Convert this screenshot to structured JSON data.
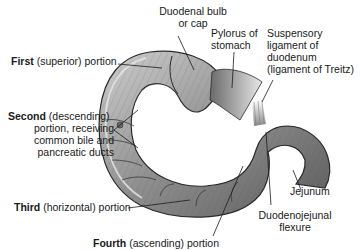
{
  "figure": {
    "colors": {
      "organ_fill": "#9a9a9a",
      "organ_dark": "#4a4a4a",
      "organ_light": "#d8d8d8",
      "outline": "#2a2a2a",
      "leader_line": "#1a1a1a",
      "background": "#ffffff"
    }
  },
  "labels": {
    "duodenal_bulb": {
      "line1": "Duodenal bulb",
      "line2": "or cap"
    },
    "pylorus": {
      "line1": "Pylorus of",
      "line2": "stomach"
    },
    "suspensory": {
      "line1": "Suspensory",
      "line2": "ligament of",
      "line3": "duodenum",
      "line4": "(ligament of Treitz)"
    },
    "first": {
      "bold": "First",
      "rest": " (superior) portion"
    },
    "second": {
      "bold": "Second",
      "rest": " (descending)",
      "line2": "portion, receiving",
      "line3": "common bile and",
      "line4": "pancreatic ducts"
    },
    "third": {
      "bold": "Third",
      "rest": " (horizontal) portion"
    },
    "fourth": {
      "bold": "Fourth",
      "rest": " (ascending) portion"
    },
    "jejunum": {
      "text": "Jejunum"
    },
    "flexure": {
      "line1": "Duodenojejunal",
      "line2": "flexure"
    }
  }
}
